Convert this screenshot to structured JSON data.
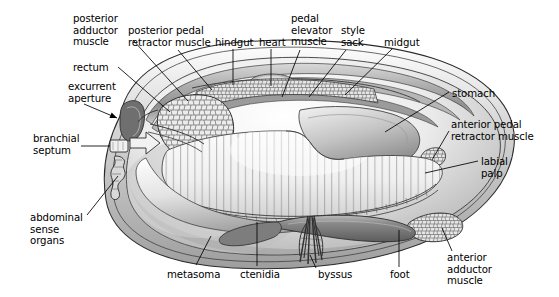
{
  "figure": {
    "organism": "bivalve mollusc",
    "view": "sagittal / median section, anterior to the right",
    "background_color": "#ffffff",
    "line_color": "#000000",
    "shell_fill": "#c8c8c8",
    "mantle_fill": "#d8d8d8",
    "ctenidia_fill": "#f2f2f2",
    "gonad_fill": "#e8e8e8",
    "foot_fill": "#8e8e8e",
    "style": "grayscale shaded line drawing"
  },
  "labels": [
    {
      "id": "posterior-adductor-muscle",
      "text": "posterior\nadductor\nmuscle",
      "x": 73,
      "y": 13,
      "align": "left",
      "leader": [
        [
          133,
          40
        ],
        [
          188,
          101
        ]
      ],
      "leader_style": "line"
    },
    {
      "id": "posterior-pedal-retractor-muscle",
      "text": "posterior pedal\nretractor muscle",
      "x": 128,
      "y": 25,
      "align": "left",
      "leader": [
        [
          178,
          50
        ],
        [
          212,
          90
        ]
      ],
      "leader_style": "line"
    },
    {
      "id": "hindgut",
      "text": "hindgut",
      "x": 215,
      "y": 37,
      "align": "left",
      "leader": [
        [
          233,
          49
        ],
        [
          233,
          85
        ]
      ],
      "leader_style": "line"
    },
    {
      "id": "heart",
      "text": "heart",
      "x": 259,
      "y": 37,
      "align": "left",
      "leader": [
        [
          271,
          49
        ],
        [
          271,
          86
        ]
      ],
      "leader_style": "line"
    },
    {
      "id": "pedal-elevator-muscle",
      "text": "pedal\nelevator\nmuscle",
      "x": 291,
      "y": 13,
      "align": "left",
      "leader": [
        [
          300,
          50
        ],
        [
          282,
          97
        ]
      ],
      "leader_style": "line"
    },
    {
      "id": "style-sack",
      "text": "style\nsack",
      "x": 341,
      "y": 25,
      "align": "left",
      "leader": [
        [
          346,
          50
        ],
        [
          309,
          97
        ]
      ],
      "leader_style": "line"
    },
    {
      "id": "midgut",
      "text": "midgut",
      "x": 384,
      "y": 37,
      "align": "left",
      "leader": [
        [
          392,
          49
        ],
        [
          345,
          95
        ]
      ],
      "leader_style": "line"
    },
    {
      "id": "stomach",
      "text": "stomach",
      "x": 452,
      "y": 88,
      "align": "left",
      "leader": [
        [
          449,
          92
        ],
        [
          385,
          132
        ]
      ],
      "leader_style": "line"
    },
    {
      "id": "anterior-pedal-retractor-muscle",
      "text": "anterior pedal\nretractor muscle",
      "x": 451,
      "y": 119,
      "align": "left",
      "leader": [
        [
          449,
          131
        ],
        [
          432,
          160
        ]
      ],
      "leader_style": "line"
    },
    {
      "id": "labial-palp",
      "text": "labial\npalp",
      "x": 481,
      "y": 156,
      "align": "left",
      "leader": [
        [
          478,
          161
        ],
        [
          425,
          173
        ]
      ],
      "leader_style": "line"
    },
    {
      "id": "anterior-adductor-muscle",
      "text": "anterior\nadductor\nmuscle",
      "x": 447,
      "y": 252,
      "align": "left",
      "leader": [
        [
          452,
          251
        ],
        [
          442,
          228
        ]
      ],
      "leader_style": "line"
    },
    {
      "id": "foot",
      "text": "foot",
      "x": 390,
      "y": 269,
      "align": "left",
      "leader": [
        [
          399,
          267
        ],
        [
          399,
          230
        ]
      ],
      "leader_style": "line"
    },
    {
      "id": "byssus",
      "text": "byssus",
      "x": 318,
      "y": 269,
      "align": "left",
      "leader": [
        [
          316,
          268
        ],
        [
          310,
          255
        ]
      ],
      "leader_style": "line"
    },
    {
      "id": "ctenidia",
      "text": "ctenidia",
      "x": 240,
      "y": 269,
      "align": "left",
      "leader": [
        [
          257,
          266
        ],
        [
          257,
          222
        ]
      ],
      "leader_style": "line"
    },
    {
      "id": "metasoma",
      "text": "metasoma",
      "x": 167,
      "y": 269,
      "align": "left",
      "leader": [
        [
          196,
          265
        ],
        [
          211,
          236
        ]
      ],
      "leader_style": "line"
    },
    {
      "id": "abdominal-sense-organs",
      "text": "abdominal\nsense\norgans",
      "x": 30,
      "y": 212,
      "align": "left",
      "leader": [
        [
          87,
          215
        ],
        [
          118,
          176
        ]
      ],
      "leader_style": "line"
    },
    {
      "id": "branchial-septum",
      "text": "branchial\nseptum",
      "x": 33,
      "y": 133,
      "align": "left",
      "leader": [
        [
          81,
          146
        ],
        [
          110,
          146
        ]
      ],
      "leader_style": "line"
    },
    {
      "id": "excurrent-aperture",
      "text": "excurrent\naperture",
      "x": 68,
      "y": 81,
      "align": "left",
      "leader": [
        [
          84,
          104
        ],
        [
          117,
          118
        ]
      ],
      "leader_style": "arrow"
    },
    {
      "id": "rectum",
      "text": "rectum",
      "x": 73,
      "y": 62,
      "align": "left",
      "leader": [
        [
          118,
          67
        ],
        [
          170,
          112
        ]
      ],
      "leader_style": "line"
    }
  ],
  "structures": [
    {
      "id": "shell-valve",
      "name": "shell valve (right)",
      "description": "large ovate shell outline enclosing all soft tissue"
    },
    {
      "id": "mantle-margin",
      "name": "mantle margin",
      "description": "inner rim following shell outline"
    },
    {
      "id": "posterior-adductor-muscle-body",
      "name": "posterior adductor muscle",
      "description": "cobblestone-textured oval mass, posterior-dorsal"
    },
    {
      "id": "anterior-adductor-muscle-body",
      "name": "anterior adductor muscle",
      "description": "small cobblestone-textured mass, anterior-ventral"
    },
    {
      "id": "gonad-mass",
      "name": "gonad / visceral mass",
      "description": "cobblestone-textured band along dorsal margin"
    },
    {
      "id": "ctenidia-gill",
      "name": "ctenidia (gills)",
      "description": "large vertically striated lamella occupying mantle cavity"
    },
    {
      "id": "foot-body",
      "name": "foot",
      "description": "dark elongated muscular organ, ventral anterior"
    },
    {
      "id": "byssus-threads",
      "name": "byssus threads",
      "description": "bundle of fine threads emerging ventrally"
    },
    {
      "id": "hindgut-tube",
      "name": "hindgut",
      "description": "dorsal tube running posteriorly"
    },
    {
      "id": "heart-body",
      "name": "heart",
      "description": "small rounded structure dorsal to hindgut"
    },
    {
      "id": "stomach-body",
      "name": "stomach",
      "description": "anterior-dorsal chamber"
    },
    {
      "id": "midgut-tube",
      "name": "midgut",
      "description": "curved tube joining stomach to hindgut"
    },
    {
      "id": "style-sack-body",
      "name": "style sack",
      "description": "dorsal elongate sac near midgut"
    },
    {
      "id": "labial-palp-body",
      "name": "labial palp",
      "description": "flattened anterior flap near mouth"
    },
    {
      "id": "rectum-tube",
      "name": "rectum",
      "description": "terminal gut portion opening near excurrent aperture"
    },
    {
      "id": "excurrent-aperture-opening",
      "name": "excurrent aperture",
      "description": "posterior opening for exhalant water flow"
    },
    {
      "id": "branchial-septum-body",
      "name": "branchial septum",
      "description": "transverse partition posterior of gills"
    },
    {
      "id": "abdominal-sense-organs-body",
      "name": "abdominal sense organs",
      "description": "small crenulated sensory patch posterior"
    },
    {
      "id": "metasoma-body",
      "name": "metasoma",
      "description": "posterior-ventral body region"
    },
    {
      "id": "pedal-elevator-muscle-body",
      "name": "pedal elevator muscle",
      "description": "dorsal muscle band above visceral mass"
    },
    {
      "id": "posterior-pedal-retractor-muscle-body",
      "name": "posterior pedal retractor muscle",
      "description": "band running from dorsum toward foot base"
    },
    {
      "id": "anterior-pedal-retractor-muscle-body",
      "name": "anterior pedal retractor muscle",
      "description": "small anterior-dorsal attachment"
    }
  ]
}
